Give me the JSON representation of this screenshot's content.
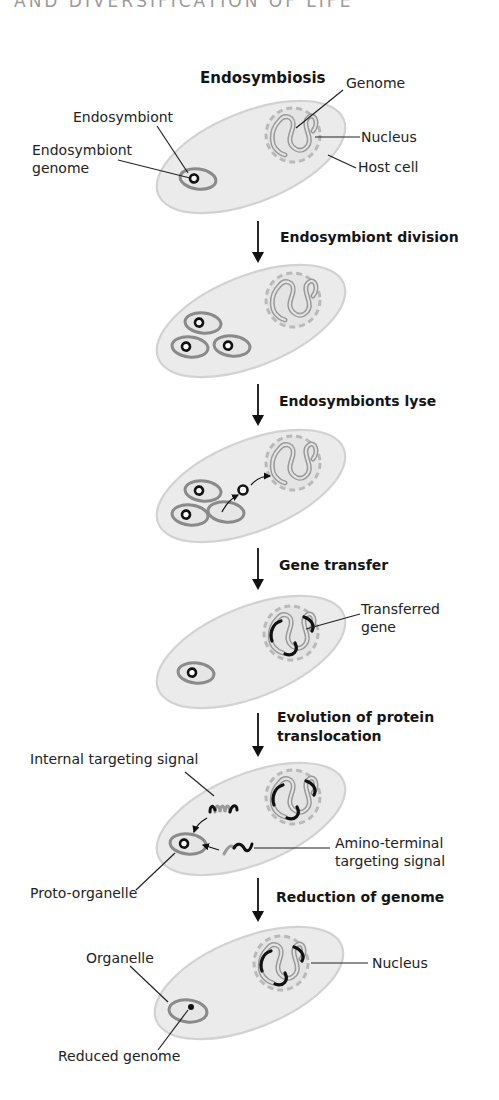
{
  "page_header": "AND DIVERSIFICATION OF LIFE",
  "title": "Endosymbiosis",
  "colors": {
    "cell_fill": "#ebebeb",
    "cell_stroke": "#d2d2d2",
    "nucleus_dash": "#b9b9b9",
    "genome_gray": "#9a9a9a",
    "endosymbiont_ring": "#8a8a8a",
    "gene_black": "#111111",
    "text": "#222222"
  },
  "stages": [
    {
      "id": "endosymbiosis",
      "labels": {
        "genome": "Genome",
        "endosymbiont": "Endosymbiont",
        "nucleus": "Nucleus",
        "endosymbiont_genome_line1": "Endosymbiont",
        "endosymbiont_genome_line2": "genome",
        "host_cell": "Host cell"
      }
    },
    {
      "id": "division",
      "step_label": "Endosymbiont division"
    },
    {
      "id": "lysis",
      "step_label": "Endosymbionts lyse"
    },
    {
      "id": "gene-transfer",
      "step_label": "Gene transfer",
      "labels": {
        "transferred_gene_line1": "Transferred",
        "transferred_gene_line2": "gene"
      }
    },
    {
      "id": "protein-translocation",
      "step_label_line1": "Evolution of protein",
      "step_label_line2": "translocation",
      "labels": {
        "internal_signal": "Internal targeting signal",
        "amino_terminal_line1": "Amino-terminal",
        "amino_terminal_line2": "targeting signal",
        "proto_organelle": "Proto-organelle"
      }
    },
    {
      "id": "genome-reduction",
      "step_label": "Reduction of genome",
      "labels": {
        "organelle": "Organelle",
        "nucleus": "Nucleus",
        "reduced_genome": "Reduced genome"
      }
    }
  ]
}
